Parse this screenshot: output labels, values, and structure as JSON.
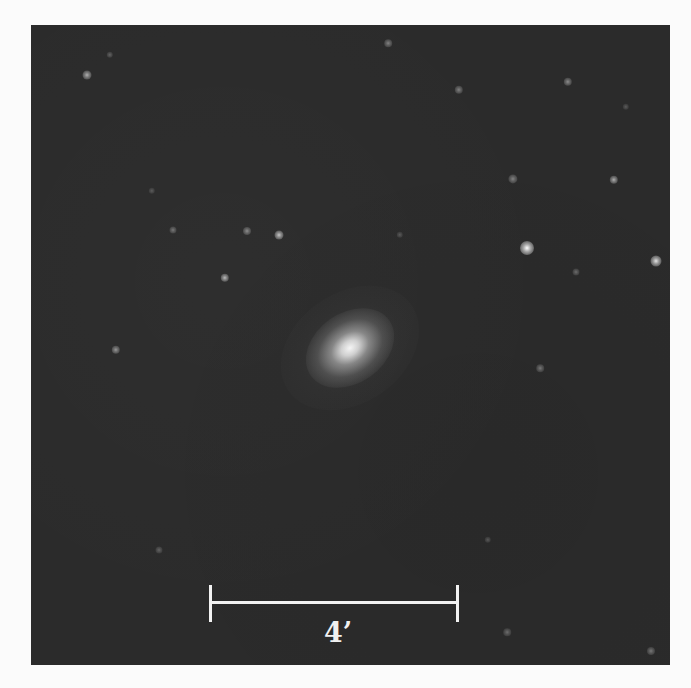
{
  "image": {
    "subject": "elliptical/spiral galaxy on dark star field",
    "background_color": "#2b2b2b",
    "page_background": "#fbfbfb"
  },
  "scale_bar": {
    "label": "4’",
    "color": "#f2f2f2"
  },
  "stars": [
    {
      "x": 56,
      "y": 50,
      "r": 2.5,
      "b": 0.7
    },
    {
      "x": 79,
      "y": 30,
      "r": 1.2,
      "b": 0.35
    },
    {
      "x": 216,
      "y": 206,
      "r": 2,
      "b": 0.55
    },
    {
      "x": 248,
      "y": 210,
      "r": 2.5,
      "b": 0.8
    },
    {
      "x": 142,
      "y": 205,
      "r": 1.5,
      "b": 0.45
    },
    {
      "x": 194,
      "y": 253,
      "r": 2.2,
      "b": 0.75
    },
    {
      "x": 85,
      "y": 325,
      "r": 2.2,
      "b": 0.6
    },
    {
      "x": 121,
      "y": 166,
      "r": 1.2,
      "b": 0.3
    },
    {
      "x": 428,
      "y": 65,
      "r": 2.2,
      "b": 0.5
    },
    {
      "x": 537,
      "y": 57,
      "r": 2.2,
      "b": 0.55
    },
    {
      "x": 482,
      "y": 154,
      "r": 2.6,
      "b": 0.5
    },
    {
      "x": 583,
      "y": 155,
      "r": 2.2,
      "b": 0.7
    },
    {
      "x": 496,
      "y": 223,
      "r": 5,
      "b": 1.0
    },
    {
      "x": 625,
      "y": 236,
      "r": 3.5,
      "b": 0.9
    },
    {
      "x": 545,
      "y": 247,
      "r": 1.5,
      "b": 0.4
    },
    {
      "x": 595,
      "y": 82,
      "r": 1.2,
      "b": 0.3
    },
    {
      "x": 509,
      "y": 343,
      "r": 1.8,
      "b": 0.45
    },
    {
      "x": 357,
      "y": 18,
      "r": 1.8,
      "b": 0.5
    },
    {
      "x": 128,
      "y": 525,
      "r": 1.5,
      "b": 0.35
    },
    {
      "x": 476,
      "y": 607,
      "r": 1.8,
      "b": 0.4
    },
    {
      "x": 620,
      "y": 626,
      "r": 2,
      "b": 0.45
    },
    {
      "x": 457,
      "y": 515,
      "r": 1.2,
      "b": 0.3
    },
    {
      "x": 369,
      "y": 210,
      "r": 1.2,
      "b": 0.3
    }
  ]
}
